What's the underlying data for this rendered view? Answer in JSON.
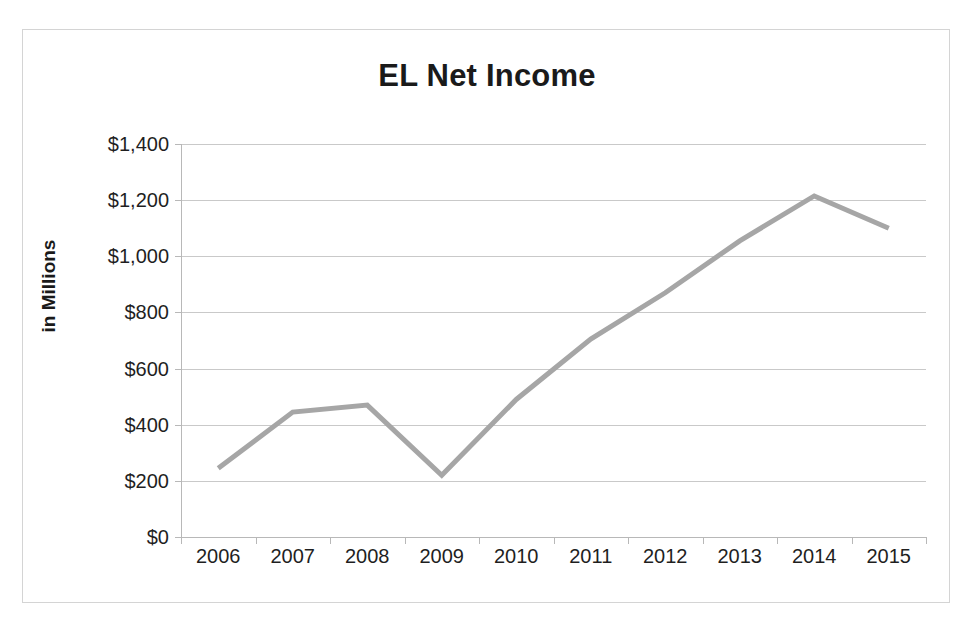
{
  "chart_data": {
    "type": "line",
    "title": "EL Net Income",
    "xlabel": "",
    "ylabel": "in Millions",
    "categories": [
      "2006",
      "2007",
      "2008",
      "2009",
      "2010",
      "2011",
      "2012",
      "2013",
      "2014",
      "2015"
    ],
    "values": [
      245,
      445,
      470,
      220,
      490,
      705,
      870,
      1055,
      1215,
      1100
    ],
    "series": [
      {
        "name": "EL Net Income",
        "values": [
          245,
          445,
          470,
          220,
          490,
          705,
          870,
          1055,
          1215,
          1100
        ]
      }
    ],
    "ylim": [
      0,
      1400
    ],
    "y_ticks": [
      0,
      200,
      400,
      600,
      800,
      1000,
      1200,
      1400
    ],
    "y_tick_labels": [
      "$0",
      "$200",
      "$400",
      "$600",
      "$800",
      "$1,000",
      "$1,200",
      "$1,400"
    ],
    "grid": true,
    "legend": false,
    "legend_position": "none",
    "line_color": "#a6a6a6",
    "line_width": 5,
    "plot_background": "#ffffff",
    "border_color": "#d4d4d4",
    "gridline_color": "#c9c9c9"
  }
}
